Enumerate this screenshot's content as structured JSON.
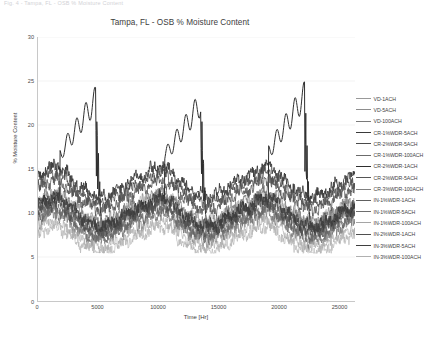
{
  "caption": {
    "text": "Fig. 4 - Tampa, FL - OSB % Moisture Content"
  },
  "chart_data": {
    "type": "line",
    "title": "Tampa, FL - OSB % Moisture Content",
    "xlabel": "Time [Hr]",
    "ylabel": "% Moisture Content",
    "xlim": [
      0,
      26280
    ],
    "ylim": [
      0,
      30
    ],
    "xticks": [
      0,
      5000,
      10000,
      15000,
      20000,
      25000
    ],
    "xtick_labels": [
      "0",
      "5000",
      "10000",
      "15000",
      "20000",
      "25000"
    ],
    "yticks": [
      0,
      5,
      10,
      15,
      20,
      25,
      30
    ],
    "ytick_labels": [
      "0",
      "5",
      "10",
      "15",
      "20",
      "25",
      "30"
    ],
    "grid": "horizontal",
    "legend_position": "right",
    "series": [
      {
        "name": "VD-1ACH",
        "color": "#999999",
        "width": 0.5,
        "band": "mid",
        "offset": 0.2,
        "amp": 1.0,
        "spike": 0.0
      },
      {
        "name": "VD-5ACH",
        "color": "#8d8d8d",
        "width": 0.5,
        "band": "mid",
        "offset": -0.3,
        "amp": 1.0,
        "spike": 0.0
      },
      {
        "name": "VD-100ACH",
        "color": "#7a7a7a",
        "width": 0.7,
        "band": "mid",
        "offset": -0.8,
        "amp": 0.95,
        "spike": 0.0
      },
      {
        "name": "CR-1%WDR-5ACH",
        "color": "#3a3a3a",
        "width": 0.9,
        "band": "high",
        "offset": 1.6,
        "amp": 1.05,
        "spike": 0.0
      },
      {
        "name": "CR-2%WDR-5ACH",
        "color": "#4a4a4a",
        "width": 0.8,
        "band": "high",
        "offset": 1.1,
        "amp": 1.02,
        "spike": 0.0
      },
      {
        "name": "CR-1%WDR-100ACH",
        "color": "#6b6b6b",
        "width": 0.6,
        "band": "mid",
        "offset": 0.5,
        "amp": 1.0,
        "spike": 0.0
      },
      {
        "name": "CR-2%WDR-1ACH",
        "color": "#2e2e2e",
        "width": 1.0,
        "band": "spike",
        "offset": 0.0,
        "amp": 1.0,
        "spike": 1.0
      },
      {
        "name": "CR-2%WDR-5ACH",
        "color": "#555555",
        "width": 0.8,
        "band": "high",
        "offset": 0.6,
        "amp": 1.0,
        "spike": 0.0
      },
      {
        "name": "CR-3%WDR-100ACH",
        "color": "#808080",
        "width": 0.6,
        "band": "mid",
        "offset": -0.1,
        "amp": 0.98,
        "spike": 0.0
      },
      {
        "name": "IN-1%WDR-1ACH",
        "color": "#606060",
        "width": 0.7,
        "band": "low",
        "offset": 0.4,
        "amp": 0.95,
        "spike": 0.0
      },
      {
        "name": "IN-1%WDR-5ACH",
        "color": "#6e6e6e",
        "width": 0.7,
        "band": "low",
        "offset": 0.0,
        "amp": 0.93,
        "spike": 0.0
      },
      {
        "name": "IN-1%WDR-100ACH",
        "color": "#a5a5a5",
        "width": 0.6,
        "band": "low",
        "offset": -0.5,
        "amp": 0.9,
        "spike": 0.0
      },
      {
        "name": "IN-2%WDR-1ACH",
        "color": "#4f4f4f",
        "width": 0.8,
        "band": "low",
        "offset": 0.8,
        "amp": 0.97,
        "spike": 0.0
      },
      {
        "name": "IN-3%WDR-5ACH",
        "color": "#3f3f3f",
        "width": 0.9,
        "band": "low",
        "offset": 1.1,
        "amp": 1.0,
        "spike": 0.0
      },
      {
        "name": "IN-3%WDR-100ACH",
        "color": "#b0b0b0",
        "width": 0.6,
        "band": "low",
        "offset": -0.9,
        "amp": 0.88,
        "spike": 0.0
      }
    ],
    "cycle_hours": 8760,
    "cycles": 3,
    "baseline_profile": {
      "note": "annual moisture cycle, peak late winter, trough late summer",
      "month_values": [
        10.5,
        11.2,
        11.6,
        11.0,
        10.0,
        9.2,
        8.6,
        8.2,
        8.4,
        8.9,
        9.6,
        10.2
      ]
    },
    "spike_peaks": [
      24.5,
      24.0,
      25.0
    ],
    "spike_peak_hours": [
      4200,
      12900,
      21500
    ]
  }
}
